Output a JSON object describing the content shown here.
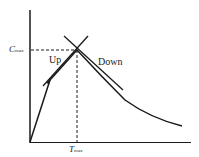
{
  "diagram": {
    "y_axis_label": {
      "main": "C",
      "sub": "max"
    },
    "x_axis_label": {
      "main": "T",
      "sub": "max"
    },
    "up_label": "Up",
    "down_label": "Down",
    "colors": {
      "line": "#1a1a1a",
      "background": "#ffffff"
    }
  }
}
